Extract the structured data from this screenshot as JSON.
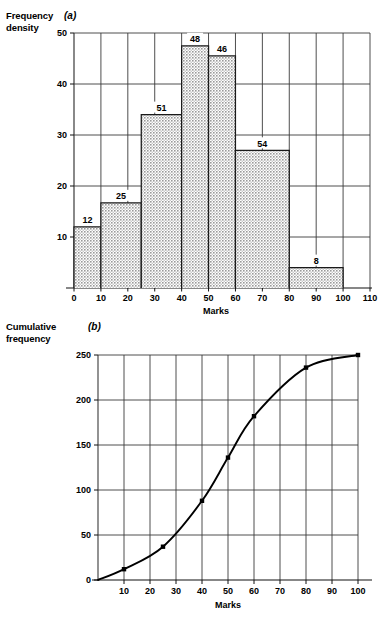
{
  "figure": {
    "panel_a": {
      "letter": "(a)",
      "y_axis_title_line1": "Frequency",
      "y_axis_title_line2": "density",
      "x_axis_label": "Marks"
    },
    "panel_b": {
      "letter": "(b)",
      "y_axis_title_line1": "Cumulative",
      "y_axis_title_line2": "frequency",
      "x_axis_label": "Marks"
    }
  },
  "chart_data": [
    {
      "type": "bar",
      "id": "panel-a-histogram",
      "title": "",
      "xlabel": "Marks",
      "ylabel": "Frequency density",
      "xlim": [
        0,
        110
      ],
      "ylim": [
        0,
        50
      ],
      "grid": true,
      "xticks": [
        0,
        10,
        20,
        30,
        40,
        50,
        60,
        70,
        80,
        90,
        100,
        110
      ],
      "yticks": [
        0,
        10,
        20,
        30,
        40,
        50
      ],
      "xtick_labels": [
        "0",
        "10",
        "20",
        "30",
        "40",
        "50",
        "60",
        "70",
        "80",
        "90",
        "100",
        "110"
      ],
      "ytick_labels": [
        "0",
        "10",
        "20",
        "30",
        "40",
        "50"
      ],
      "bins": [
        {
          "lower": 0,
          "upper": 10,
          "frequency": 12,
          "frequency_density": 12.0,
          "label": "12"
        },
        {
          "lower": 10,
          "upper": 25,
          "frequency": 25,
          "frequency_density": 16.7,
          "label": "25"
        },
        {
          "lower": 25,
          "upper": 40,
          "frequency": 51,
          "frequency_density": 34.0,
          "label": "51"
        },
        {
          "lower": 40,
          "upper": 50,
          "frequency": 48,
          "frequency_density": 47.5,
          "label": "48"
        },
        {
          "lower": 50,
          "upper": 60,
          "frequency": 46,
          "frequency_density": 45.5,
          "label": "46"
        },
        {
          "lower": 60,
          "upper": 80,
          "frequency": 54,
          "frequency_density": 27.0,
          "label": "54"
        },
        {
          "lower": 80,
          "upper": 100,
          "frequency": 8,
          "frequency_density": 4.0,
          "label": "8"
        }
      ]
    },
    {
      "type": "line",
      "id": "panel-b-cumulative-frequency",
      "title": "",
      "xlabel": "Marks",
      "ylabel": "Cumulative frequency",
      "xlim": [
        0,
        100
      ],
      "ylim": [
        0,
        250
      ],
      "grid": true,
      "markers": true,
      "xticks": [
        10,
        20,
        30,
        40,
        50,
        60,
        70,
        80,
        90,
        100
      ],
      "yticks": [
        0,
        50,
        100,
        150,
        200,
        250
      ],
      "xtick_labels": [
        "10",
        "20",
        "30",
        "40",
        "50",
        "60",
        "70",
        "80",
        "90",
        "100"
      ],
      "ytick_labels": [
        "0",
        "50",
        "100",
        "150",
        "200",
        "250"
      ],
      "series": [
        {
          "name": "Cumulative frequency",
          "x": [
            0,
            10,
            25,
            40,
            50,
            60,
            80,
            100
          ],
          "y": [
            0,
            12,
            37,
            88,
            136,
            182,
            236,
            250
          ]
        }
      ]
    }
  ]
}
